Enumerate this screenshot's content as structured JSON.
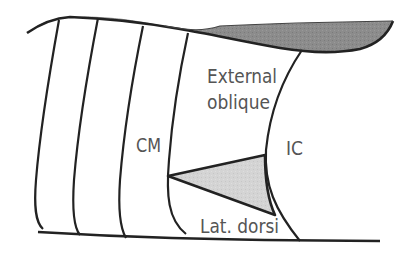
{
  "diagram": {
    "labels": {
      "external_oblique_line1": "External",
      "external_oblique_line2": "oblique",
      "cm": "CM",
      "ic": "IC",
      "lat_dorsi": "Lat. dorsi"
    },
    "colors": {
      "stroke": "#222222",
      "band_fill": "#8a8a8a",
      "triangle_fill": "#d2d2d2",
      "text": "#555555",
      "background": "#ffffff"
    }
  }
}
